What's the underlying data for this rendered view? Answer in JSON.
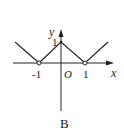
{
  "figure": {
    "caption": "B",
    "axes": {
      "x_label": "x",
      "y_label": "y",
      "origin_label": "O",
      "x_ticks": [
        "-1",
        "1"
      ],
      "y_ticks": [
        "1"
      ]
    },
    "function": {
      "description": "Piecewise linear V-shaped graph: peak at (0,1), open points at (-1,0) and (1,0), rising branches outward",
      "points": [
        {
          "x": -2,
          "y": 1
        },
        {
          "x": -1,
          "y": 0,
          "open": true
        },
        {
          "x": 0,
          "y": 1
        },
        {
          "x": 1,
          "y": 0,
          "open": true
        },
        {
          "x": 2,
          "y": 1
        }
      ]
    },
    "colors": {
      "stroke": "#222222",
      "background": "#ffffff"
    }
  }
}
